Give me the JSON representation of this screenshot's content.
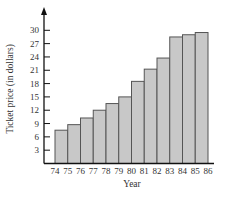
{
  "chart_data": {
    "type": "bar",
    "title": "",
    "xlabel": "Year",
    "ylabel": "Ticket price (in dollars)",
    "x_tick_labels": [
      "74",
      "75",
      "76",
      "77",
      "78",
      "79",
      "80",
      "81",
      "82",
      "83",
      "84",
      "85",
      "86"
    ],
    "categories": [
      "74",
      "75",
      "76",
      "77",
      "78",
      "79",
      "80",
      "81",
      "82",
      "83",
      "84",
      "85"
    ],
    "values": [
      7.5,
      8.75,
      10.25,
      12,
      13.5,
      15,
      18.5,
      21.25,
      23.75,
      28.5,
      29,
      29.5
    ],
    "y_ticks": [
      3,
      6,
      9,
      12,
      15,
      18,
      21,
      24,
      27,
      30
    ],
    "ylim": [
      0,
      33
    ],
    "grid": false,
    "legend": null,
    "bar_color": "#c8c8c8",
    "bar_edge_color": "#555555",
    "bars_span_between_labels": true
  }
}
